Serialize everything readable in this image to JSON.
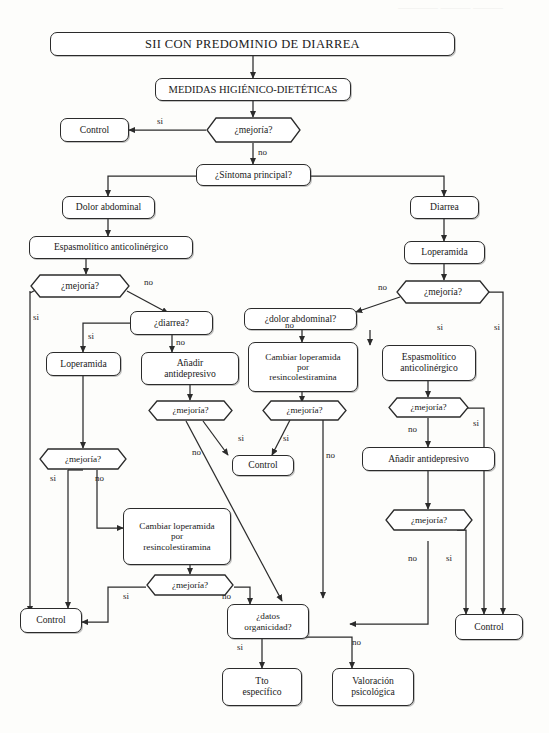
{
  "diagram": {
    "title": "SII CON PREDOMINIO DE DIARREA",
    "language": "es",
    "type": "clinical-decision-flowchart",
    "edge_labels": {
      "yes": "si",
      "no": "no"
    }
  },
  "nodes": {
    "title": "SII CON PREDOMINIO DE DIARREA",
    "medidas": "MEDIDAS HIGIÉNICO-DIETÉTICAS",
    "mejoria_1": "¿mejoría?",
    "control_1": "Control",
    "sintoma_principal": "¿Síntoma principal?",
    "dolor_abdominal": "Dolor abdominal",
    "diarrea": "Diarrea",
    "espasmolitico_l": "Espasmolítico anticolinérgico",
    "loperamida_r": "Loperamida",
    "mejoria_l1": "¿mejoría?",
    "mejoria_r1": "¿mejoría?",
    "diarrea_q": "¿diarrea?",
    "dolor_q": "¿dolor abdominal?",
    "loperamida_l": "Loperamida",
    "anadir_antidep_l_line1": "Añadir",
    "anadir_antidep_l_line2": "antidepresivo",
    "cambiar_m_line1": "Cambiar loperamida",
    "cambiar_m_line2": "por",
    "cambiar_m_line3": "resincolestiramina",
    "espasmolitico_r_line1": "Espasmolítico",
    "espasmolitico_r_line2": "anticolinérgico",
    "mejoria_l2": "¿mejoría?",
    "mejoria_m2": "¿mejoría?",
    "mejoria_r2": "¿mejoría?",
    "control_2": "Control",
    "mejoria_l3": "¿mejoría?",
    "anadir_antidep_r": "Añadir antidepresivo",
    "cambiar_b_line1": "Cambiar loperamida",
    "cambiar_b_line2": "por",
    "cambiar_b_line3": "resincolestiramina",
    "mejoria_r3": "¿mejoría?",
    "mejoria_b": "¿mejoría?",
    "control_bottom_left": "Control",
    "control_bottom_right": "Control",
    "datos_line1": "¿datos",
    "datos_line2": "organicidad?",
    "tto_line1": "Tto",
    "tto_line2": "específico",
    "valoracion_line1": "Valoración",
    "valoracion_line2": "psicológica"
  },
  "edges": {
    "e01_no": "no",
    "e02_si": "si",
    "e_l_mejoria_no": "no",
    "e_l_mejoria_si": "si",
    "e_diarrea_si": "si",
    "e_diarrea_no": "no",
    "e_r_mejoria_no": "no",
    "e_r_mejoria_si": "si",
    "e_dolor_no": "no",
    "e_dolor_si": "si",
    "e_l2_si": "si",
    "e_l2_no": "no",
    "e_m2_si": "si",
    "e_m2_no": "no",
    "e_mid_si": "si",
    "e_mid_no": "no",
    "e_r2_si": "si",
    "e_r2_no": "no",
    "e_r3_si": "si",
    "e_r3_no": "no",
    "e_b_si": "si",
    "e_b_no": "no",
    "e_datos_si": "si",
    "e_datos_no": "no"
  },
  "colors": {
    "stroke": "#2b2b2b",
    "text": "#1a1a1a",
    "background": "#fdfdfb"
  }
}
